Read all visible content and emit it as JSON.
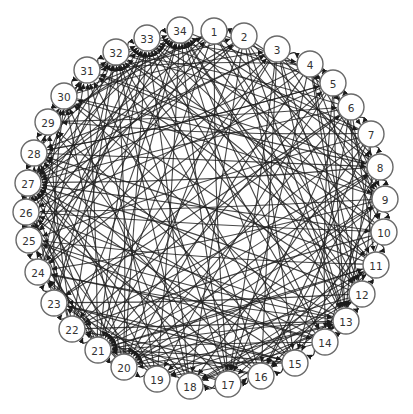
{
  "diagram": {
    "type": "directed-graph",
    "layout": "circular",
    "node_count": 34,
    "colors": {
      "edge": "#1e1e1e",
      "node_fill": "#ffffff",
      "node_stroke": "#6a6a6a",
      "label": "#333333"
    },
    "node_radius": 13,
    "nodes": [
      {
        "id": "1",
        "label": "1",
        "x": 214,
        "y": 31
      },
      {
        "id": "2",
        "label": "2",
        "x": 244,
        "y": 36
      },
      {
        "id": "3",
        "label": "3",
        "x": 277,
        "y": 49
      },
      {
        "id": "4",
        "label": "4",
        "x": 310,
        "y": 64
      },
      {
        "id": "5",
        "label": "5",
        "x": 333,
        "y": 83
      },
      {
        "id": "6",
        "label": "6",
        "x": 351,
        "y": 107
      },
      {
        "id": "7",
        "label": "7",
        "x": 371,
        "y": 134
      },
      {
        "id": "8",
        "label": "8",
        "x": 380,
        "y": 167
      },
      {
        "id": "9",
        "label": "9",
        "x": 385,
        "y": 199
      },
      {
        "id": "10",
        "label": "10",
        "x": 384,
        "y": 232
      },
      {
        "id": "11",
        "label": "11",
        "x": 376,
        "y": 265
      },
      {
        "id": "12",
        "label": "12",
        "x": 362,
        "y": 294
      },
      {
        "id": "13",
        "label": "13",
        "x": 346,
        "y": 321
      },
      {
        "id": "14",
        "label": "14",
        "x": 325,
        "y": 342
      },
      {
        "id": "15",
        "label": "15",
        "x": 295,
        "y": 363
      },
      {
        "id": "16",
        "label": "16",
        "x": 261,
        "y": 376
      },
      {
        "id": "17",
        "label": "17",
        "x": 228,
        "y": 384
      },
      {
        "id": "18",
        "label": "18",
        "x": 190,
        "y": 386
      },
      {
        "id": "19",
        "label": "19",
        "x": 157,
        "y": 379
      },
      {
        "id": "20",
        "label": "20",
        "x": 124,
        "y": 367
      },
      {
        "id": "21",
        "label": "21",
        "x": 98,
        "y": 350
      },
      {
        "id": "22",
        "label": "22",
        "x": 72,
        "y": 329
      },
      {
        "id": "23",
        "label": "23",
        "x": 54,
        "y": 303
      },
      {
        "id": "24",
        "label": "24",
        "x": 38,
        "y": 272
      },
      {
        "id": "25",
        "label": "25",
        "x": 29,
        "y": 240
      },
      {
        "id": "26",
        "label": "26",
        "x": 26,
        "y": 212
      },
      {
        "id": "27",
        "label": "27",
        "x": 28,
        "y": 183
      },
      {
        "id": "28",
        "label": "28",
        "x": 34,
        "y": 153
      },
      {
        "id": "29",
        "label": "29",
        "x": 48,
        "y": 122
      },
      {
        "id": "30",
        "label": "30",
        "x": 64,
        "y": 96
      },
      {
        "id": "31",
        "label": "31",
        "x": 87,
        "y": 70
      },
      {
        "id": "32",
        "label": "32",
        "x": 116,
        "y": 52
      },
      {
        "id": "33",
        "label": "33",
        "x": 147,
        "y": 38
      },
      {
        "id": "34",
        "label": "34",
        "x": 180,
        "y": 30
      }
    ],
    "perimeter_arcs": [
      [
        "33",
        "34"
      ],
      [
        "1",
        "2"
      ],
      [
        "3",
        "4"
      ],
      [
        "4",
        "5"
      ],
      [
        "5",
        "6"
      ],
      [
        "6",
        "7"
      ],
      [
        "7",
        "8"
      ],
      [
        "8",
        "9"
      ],
      [
        "9",
        "10"
      ],
      [
        "10",
        "11"
      ],
      [
        "11",
        "12"
      ],
      [
        "12",
        "13"
      ],
      [
        "13",
        "14"
      ],
      [
        "14",
        "15"
      ],
      [
        "15",
        "16"
      ],
      [
        "16",
        "17"
      ],
      [
        "17",
        "18"
      ],
      [
        "18",
        "16"
      ],
      [
        "19",
        "20"
      ],
      [
        "20",
        "21"
      ],
      [
        "21",
        "22"
      ],
      [
        "22",
        "23"
      ],
      [
        "23",
        "24"
      ],
      [
        "24",
        "25"
      ],
      [
        "25",
        "26"
      ],
      [
        "26",
        "27"
      ],
      [
        "27",
        "28"
      ],
      [
        "28",
        "29"
      ],
      [
        "29",
        "30"
      ],
      [
        "30",
        "31"
      ],
      [
        "31",
        "32"
      ],
      [
        "32",
        "33"
      ]
    ],
    "edges": [
      [
        "1",
        "13"
      ],
      [
        "1",
        "21"
      ],
      [
        "1",
        "27"
      ],
      [
        "1",
        "9"
      ],
      [
        "1",
        "17"
      ],
      [
        "1",
        "24"
      ],
      [
        "1",
        "30"
      ],
      [
        "2",
        "13"
      ],
      [
        "2",
        "20"
      ],
      [
        "2",
        "27"
      ],
      [
        "2",
        "11"
      ],
      [
        "2",
        "25"
      ],
      [
        "2",
        "18"
      ],
      [
        "3",
        "21"
      ],
      [
        "3",
        "13"
      ],
      [
        "3",
        "28"
      ],
      [
        "3",
        "17"
      ],
      [
        "3",
        "22"
      ],
      [
        "3",
        "9"
      ],
      [
        "4",
        "20"
      ],
      [
        "4",
        "27"
      ],
      [
        "4",
        "13"
      ],
      [
        "4",
        "24"
      ],
      [
        "4",
        "12"
      ],
      [
        "4",
        "31"
      ],
      [
        "4",
        "17"
      ],
      [
        "5",
        "21"
      ],
      [
        "5",
        "26"
      ],
      [
        "5",
        "13"
      ],
      [
        "5",
        "19"
      ],
      [
        "5",
        "28"
      ],
      [
        "5",
        "10"
      ],
      [
        "6",
        "20"
      ],
      [
        "6",
        "27"
      ],
      [
        "6",
        "32"
      ],
      [
        "6",
        "13"
      ],
      [
        "6",
        "23"
      ],
      [
        "6",
        "17"
      ],
      [
        "7",
        "21"
      ],
      [
        "7",
        "25"
      ],
      [
        "7",
        "29"
      ],
      [
        "7",
        "13"
      ],
      [
        "7",
        "18"
      ],
      [
        "7",
        "33"
      ],
      [
        "8",
        "20"
      ],
      [
        "8",
        "27"
      ],
      [
        "8",
        "31"
      ],
      [
        "8",
        "22"
      ],
      [
        "8",
        "16"
      ],
      [
        "8",
        "34"
      ],
      [
        "9",
        "21"
      ],
      [
        "9",
        "26"
      ],
      [
        "9",
        "30"
      ],
      [
        "9",
        "19"
      ],
      [
        "9",
        "33"
      ],
      [
        "9",
        "24"
      ],
      [
        "10",
        "20"
      ],
      [
        "10",
        "27"
      ],
      [
        "10",
        "32"
      ],
      [
        "10",
        "22"
      ],
      [
        "10",
        "34"
      ],
      [
        "10",
        "17"
      ],
      [
        "11",
        "21"
      ],
      [
        "11",
        "28"
      ],
      [
        "11",
        "33"
      ],
      [
        "11",
        "25"
      ],
      [
        "11",
        "18"
      ],
      [
        "11",
        "31"
      ],
      [
        "12",
        "20"
      ],
      [
        "12",
        "27"
      ],
      [
        "12",
        "34"
      ],
      [
        "12",
        "23"
      ],
      [
        "12",
        "30"
      ],
      [
        "12",
        "18"
      ],
      [
        "13",
        "21"
      ],
      [
        "13",
        "26"
      ],
      [
        "13",
        "32"
      ],
      [
        "13",
        "28"
      ],
      [
        "13",
        "19"
      ],
      [
        "13",
        "34"
      ],
      [
        "13",
        "24"
      ],
      [
        "14",
        "27"
      ],
      [
        "14",
        "33"
      ],
      [
        "14",
        "21"
      ],
      [
        "14",
        "30"
      ],
      [
        "14",
        "25"
      ],
      [
        "15",
        "27"
      ],
      [
        "15",
        "32"
      ],
      [
        "15",
        "21"
      ],
      [
        "15",
        "29"
      ],
      [
        "15",
        "34"
      ],
      [
        "15",
        "23"
      ],
      [
        "16",
        "28"
      ],
      [
        "16",
        "33"
      ],
      [
        "16",
        "21"
      ],
      [
        "16",
        "31"
      ],
      [
        "16",
        "26"
      ],
      [
        "17",
        "27"
      ],
      [
        "17",
        "32"
      ],
      [
        "17",
        "29"
      ],
      [
        "17",
        "34"
      ],
      [
        "17",
        "22"
      ],
      [
        "18",
        "30"
      ],
      [
        "18",
        "33"
      ],
      [
        "18",
        "27"
      ],
      [
        "18",
        "24"
      ],
      [
        "18",
        "32"
      ],
      [
        "19",
        "28"
      ],
      [
        "19",
        "34"
      ],
      [
        "19",
        "31"
      ],
      [
        "19",
        "26"
      ],
      [
        "20",
        "30"
      ],
      [
        "20",
        "33"
      ],
      [
        "20",
        "27"
      ],
      [
        "20",
        "32"
      ],
      [
        "20",
        "25"
      ],
      [
        "21",
        "28"
      ],
      [
        "21",
        "34"
      ],
      [
        "21",
        "31"
      ],
      [
        "21",
        "26"
      ],
      [
        "21",
        "33"
      ],
      [
        "22",
        "29"
      ],
      [
        "22",
        "32"
      ],
      [
        "22",
        "27"
      ],
      [
        "22",
        "34"
      ],
      [
        "23",
        "30"
      ],
      [
        "23",
        "33"
      ],
      [
        "23",
        "27"
      ],
      [
        "23",
        "32"
      ],
      [
        "24",
        "31"
      ],
      [
        "24",
        "34"
      ],
      [
        "24",
        "28"
      ],
      [
        "24",
        "33"
      ],
      [
        "25",
        "32"
      ],
      [
        "25",
        "30"
      ],
      [
        "25",
        "34"
      ],
      [
        "26",
        "31"
      ],
      [
        "26",
        "33"
      ],
      [
        "26",
        "29"
      ],
      [
        "27",
        "32"
      ],
      [
        "27",
        "34"
      ],
      [
        "27",
        "30"
      ],
      [
        "28",
        "33"
      ],
      [
        "28",
        "31"
      ],
      [
        "29",
        "34"
      ],
      [
        "29",
        "32"
      ],
      [
        "30",
        "33"
      ],
      [
        "31",
        "34"
      ],
      [
        "3",
        "12"
      ],
      [
        "5",
        "14"
      ],
      [
        "6",
        "15"
      ],
      [
        "7",
        "16"
      ],
      [
        "8",
        "14"
      ],
      [
        "2",
        "8"
      ],
      [
        "4",
        "10"
      ],
      [
        "3",
        "7"
      ],
      [
        "1",
        "5"
      ],
      [
        "2",
        "6"
      ],
      [
        "11",
        "16"
      ],
      [
        "9",
        "15"
      ],
      [
        "10",
        "14"
      ],
      [
        "12",
        "16"
      ],
      [
        "6",
        "11"
      ],
      [
        "5",
        "9"
      ],
      [
        "4",
        "8"
      ],
      [
        "7",
        "12"
      ],
      [
        "14",
        "19"
      ],
      [
        "13",
        "18"
      ],
      [
        "15",
        "20"
      ],
      [
        "16",
        "22"
      ],
      [
        "17",
        "23"
      ],
      [
        "19",
        "24"
      ],
      [
        "20",
        "24"
      ],
      [
        "21",
        "25"
      ],
      [
        "22",
        "26"
      ],
      [
        "1",
        "12"
      ],
      [
        "2",
        "15"
      ],
      [
        "3",
        "16"
      ],
      [
        "34",
        "14"
      ],
      [
        "33",
        "12"
      ],
      [
        "32",
        "11"
      ],
      [
        "31",
        "9"
      ],
      [
        "30",
        "8"
      ],
      [
        "29",
        "6"
      ],
      [
        "28",
        "5"
      ],
      [
        "27",
        "3"
      ],
      [
        "26",
        "2"
      ],
      [
        "25",
        "1"
      ],
      [
        "24",
        "3"
      ],
      [
        "23",
        "5"
      ],
      [
        "22",
        "6"
      ],
      [
        "21",
        "8"
      ],
      [
        "20",
        "9"
      ],
      [
        "19",
        "11"
      ],
      [
        "18",
        "12"
      ],
      [
        "17",
        "13"
      ],
      [
        "32",
        "7"
      ],
      [
        "33",
        "4"
      ],
      [
        "34",
        "5"
      ],
      [
        "31",
        "2"
      ],
      [
        "30",
        "3"
      ],
      [
        "29",
        "1"
      ],
      [
        "28",
        "8"
      ],
      [
        "26",
        "10"
      ],
      [
        "25",
        "13"
      ],
      [
        "24",
        "14"
      ],
      [
        "23",
        "15"
      ],
      [
        "22",
        "13"
      ],
      [
        "21",
        "11"
      ],
      [
        "20",
        "13"
      ]
    ]
  }
}
